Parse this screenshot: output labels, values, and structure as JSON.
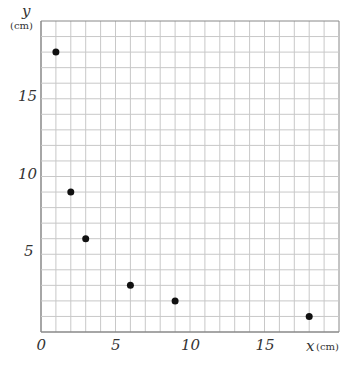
{
  "chart_data": {
    "type": "scatter",
    "title": "",
    "xlabel": "x",
    "xunit": "(cm)",
    "ylabel": "y",
    "yunit": "(cm)",
    "xlim": [
      0,
      20
    ],
    "ylim": [
      0,
      20
    ],
    "grid": true,
    "x_ticks": [
      "0",
      "5",
      "10",
      "15"
    ],
    "y_ticks": [
      "5",
      "10",
      "15"
    ],
    "points": [
      {
        "x": 1,
        "y": 18
      },
      {
        "x": 2,
        "y": 9
      },
      {
        "x": 3,
        "y": 6
      },
      {
        "x": 6,
        "y": 3
      },
      {
        "x": 9,
        "y": 2
      },
      {
        "x": 18,
        "y": 1
      }
    ]
  },
  "colors": {
    "grid": "#c8c8c8",
    "axis": "#888888",
    "point": "#111111"
  }
}
